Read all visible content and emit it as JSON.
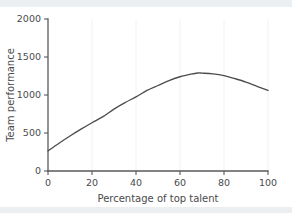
{
  "chart_data": {
    "type": "line",
    "title": "",
    "xlabel": "Percentage of top talent",
    "ylabel": "Team performance",
    "xlim": [
      0,
      100
    ],
    "ylim": [
      0,
      2000
    ],
    "xticks": [
      0,
      20,
      40,
      60,
      80,
      100
    ],
    "yticks": [
      0,
      500,
      1000,
      1500,
      2000
    ],
    "xtick_labels": [
      "0",
      "20",
      "40",
      "60",
      "80",
      "100"
    ],
    "ytick_labels": [
      "0",
      "500",
      "1000",
      "1500",
      "2000"
    ],
    "grid": false,
    "legend": null,
    "series": [
      {
        "name": "Team performance",
        "color": "#4d4d4f",
        "x": [
          0,
          5,
          10,
          15,
          20,
          25,
          30,
          35,
          40,
          45,
          50,
          55,
          60,
          65,
          68,
          70,
          75,
          80,
          85,
          90,
          95,
          100
        ],
        "y": [
          265,
          365,
          460,
          550,
          635,
          715,
          815,
          900,
          975,
          1060,
          1125,
          1190,
          1240,
          1275,
          1290,
          1288,
          1278,
          1255,
          1215,
          1170,
          1115,
          1060
        ]
      }
    ],
    "annotations": []
  },
  "figure": {
    "background": "#ffffff",
    "band_color": "#eceff1",
    "axis_color": "#58595b",
    "curve_color": "#4d4d4f"
  }
}
